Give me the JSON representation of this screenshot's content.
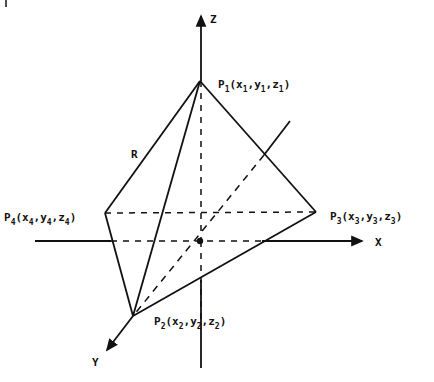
{
  "diagram": {
    "type": "tetrahedron-in-3d-axes",
    "axes": {
      "x_label": "X",
      "y_label": "Y",
      "z_label": "Z"
    },
    "points": [
      {
        "name": "P",
        "index": "1",
        "coords": [
          "x",
          "y",
          "z"
        ],
        "label": "P1(x1,y1,z1)"
      },
      {
        "name": "P",
        "index": "2",
        "coords": [
          "x",
          "y",
          "z"
        ],
        "label": "P2(x2,y2,z2)"
      },
      {
        "name": "P",
        "index": "3",
        "coords": [
          "x",
          "y",
          "z"
        ],
        "label": "P3(x3,y3,z3)"
      },
      {
        "name": "P",
        "index": "4",
        "coords": [
          "x",
          "y",
          "z"
        ],
        "label": "P4(x4,y4,z4)"
      }
    ],
    "edge_label": "R",
    "colors": {
      "line": "#111111",
      "background": "#ffffff"
    }
  }
}
